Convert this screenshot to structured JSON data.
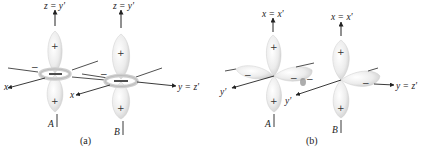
{
  "figure": {
    "panels": [
      {
        "id": "a",
        "caption": "(a)",
        "orbitals": [
          {
            "label": "A",
            "top_axis_label": "z = y'",
            "upper_lobe_sign": "+",
            "lower_lobe_sign": "+",
            "ring_sign": "−"
          },
          {
            "label": "B",
            "top_axis_label": "z = y'",
            "upper_lobe_sign": "+",
            "lower_lobe_sign": "+",
            "ring_sign": "−"
          }
        ],
        "axis_labels": {
          "x_A": "x",
          "x_B": "x",
          "right": "y = z'"
        }
      },
      {
        "id": "b",
        "caption": "(b)",
        "orbitals": [
          {
            "label": "A",
            "top_axis_label": "x = x'",
            "upper_lobe_sign": "+",
            "lower_lobe_sign": "+",
            "left_lobe_sign": "−",
            "right_lobe_sign": "−"
          },
          {
            "label": "B",
            "top_axis_label": "x = x'",
            "upper_lobe_sign": "+",
            "lower_lobe_sign": "+",
            "left_lobe_sign": "−",
            "right_lobe_sign": "−"
          }
        ],
        "axis_labels": {
          "yprime_A": "y'",
          "yprime_B": "y'",
          "right": "y = z'"
        }
      }
    ],
    "colors": {
      "lobe_fill": "#ececec",
      "lobe_edge": "#c8c8c8",
      "axis": "#222222"
    }
  }
}
